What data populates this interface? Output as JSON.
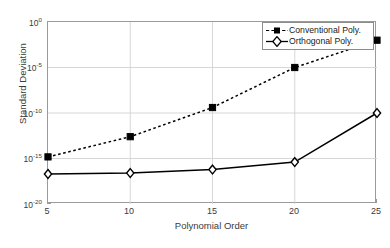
{
  "chart_data": {
    "type": "line",
    "title": "",
    "xlabel": "Polynomial Order",
    "ylabel": "Standard Deviation",
    "x": [
      5,
      10,
      15,
      20,
      25
    ],
    "xticklabels": [
      "5",
      "10",
      "15",
      "20",
      "25"
    ],
    "xlim": [
      5,
      25
    ],
    "yscale": "log",
    "ylim": [
      1e-20,
      1
    ],
    "yticklabels": [
      "10^0",
      "10^-5",
      "10^-10",
      "10^-15",
      "10^-20"
    ],
    "ytick_mantissa": [
      "10",
      "10",
      "10",
      "10",
      "10"
    ],
    "ytick_exponent": [
      "0",
      "-5",
      "-10",
      "-15",
      "-20"
    ],
    "grid": true,
    "legend_position": "top-right",
    "series": [
      {
        "name": "Conventional Poly.",
        "marker": "filled-square",
        "linestyle": "dashed",
        "color": "#000000",
        "values": [
          1.5e-15,
          2.5e-13,
          4e-10,
          1e-05,
          0.01
        ]
      },
      {
        "name": "Orthogonal Poly.",
        "marker": "open-diamond",
        "linestyle": "solid",
        "color": "#000000",
        "values": [
          2e-17,
          2.5e-17,
          6e-17,
          4e-16,
          1e-10
        ]
      }
    ]
  },
  "legend": {
    "entries": [
      {
        "label": "Conventional Poly."
      },
      {
        "label": "Orthogonal Poly."
      }
    ]
  },
  "axes": {
    "xlabel": "Polynomial Order",
    "ylabel": "Standard Deviation"
  }
}
